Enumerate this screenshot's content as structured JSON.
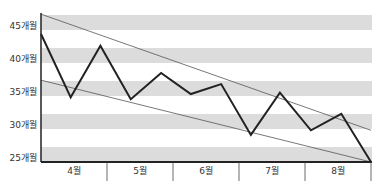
{
  "chart_data": {
    "type": "line",
    "title": "",
    "xlabel": "",
    "ylabel": "",
    "categories": [
      "4월",
      "5월",
      "6월",
      "7월",
      "8월"
    ],
    "y_ticks": [
      "25개월",
      "30개월",
      "35개월",
      "40개월",
      "45개월"
    ],
    "y_tick_values": [
      25,
      30,
      35,
      40,
      45
    ],
    "ylim": [
      25,
      47.4
    ],
    "grid": "horizontal alternating gray bands",
    "legend": "none",
    "series": [
      {
        "name": "main",
        "color": "#222222",
        "points": [
          {
            "x": 0.0,
            "y": 44.4
          },
          {
            "x": 0.45,
            "y": 34.8
          },
          {
            "x": 0.9,
            "y": 42.6
          },
          {
            "x": 1.36,
            "y": 34.5
          },
          {
            "x": 1.82,
            "y": 38.5
          },
          {
            "x": 2.27,
            "y": 35.3
          },
          {
            "x": 2.73,
            "y": 36.8
          },
          {
            "x": 3.18,
            "y": 29.1
          },
          {
            "x": 3.62,
            "y": 35.5
          },
          {
            "x": 4.09,
            "y": 29.8
          },
          {
            "x": 4.55,
            "y": 32.3
          },
          {
            "x": 5.0,
            "y": 25.0
          }
        ]
      }
    ],
    "trend_lines": [
      {
        "name": "upper-trend",
        "color": "#555555",
        "start": {
          "x": 0,
          "y": 47.4
        },
        "end": {
          "x": 5,
          "y": 29.8
        }
      },
      {
        "name": "lower-trend",
        "color": "#555555",
        "start": {
          "x": 0,
          "y": 37.4
        },
        "end": {
          "x": 5,
          "y": 25.0
        }
      }
    ]
  },
  "colors": {
    "band": "#dcdcdc",
    "axis": "#222222",
    "line": "#222222",
    "trend": "#555555"
  }
}
